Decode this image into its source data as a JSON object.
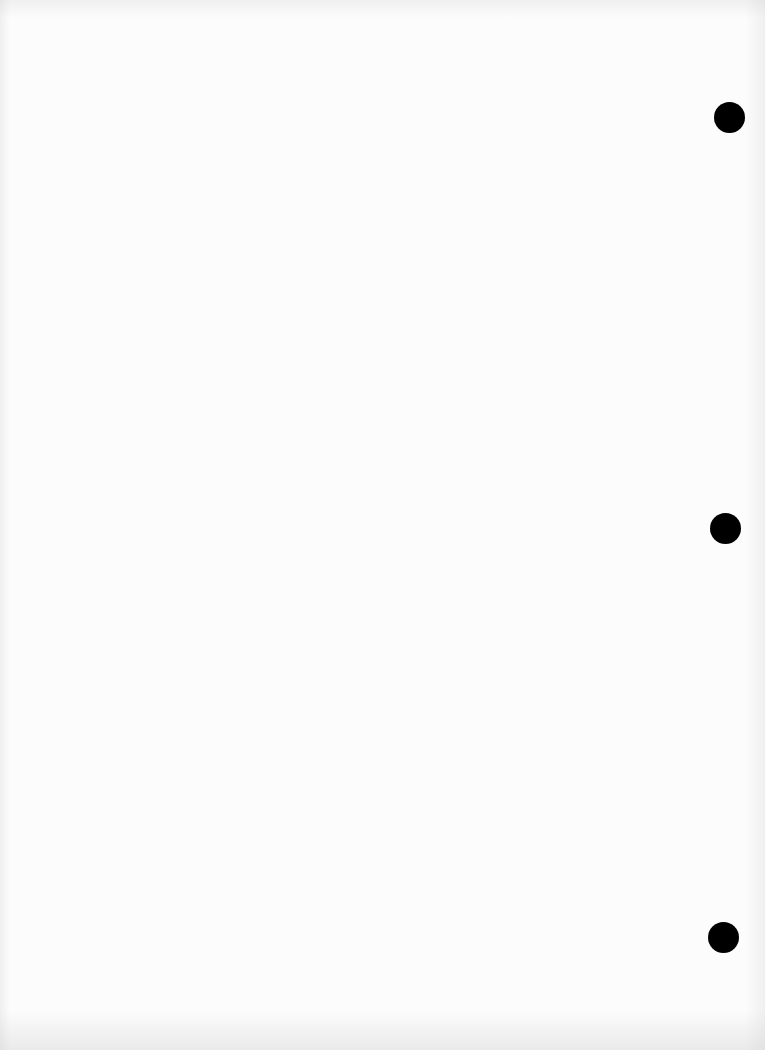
{
  "page": {
    "type": "blank binder sheet",
    "background_color": "#fcfcfc",
    "bleed_through_text": ""
  },
  "punch_holes": [
    {
      "cx": 729,
      "cy": 117,
      "r": 15,
      "color": "#000000"
    },
    {
      "cx": 725,
      "cy": 528,
      "r": 15,
      "color": "#000000"
    },
    {
      "cx": 723,
      "cy": 937,
      "r": 15,
      "color": "#000000"
    }
  ]
}
